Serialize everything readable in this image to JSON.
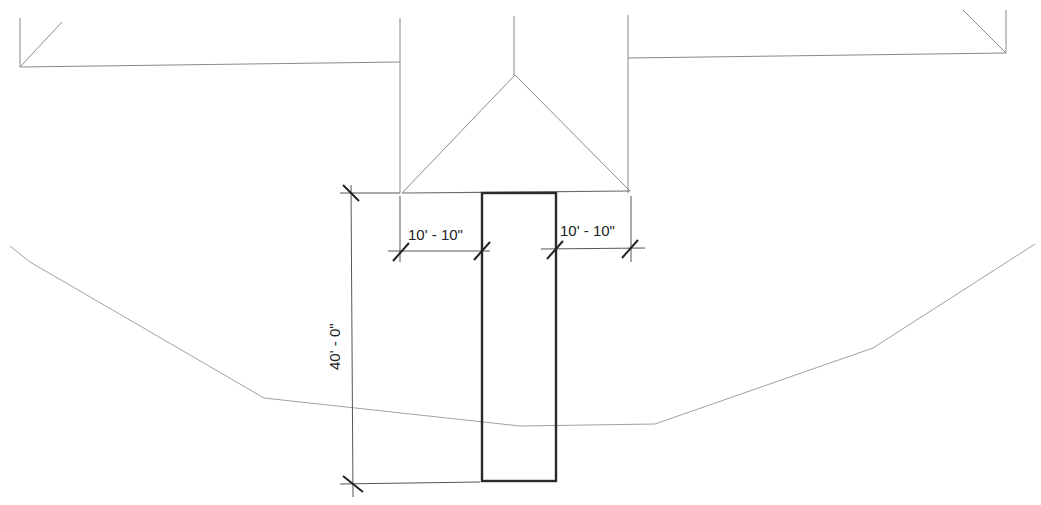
{
  "drawing": {
    "type": "architectural-plan",
    "colors": {
      "line": "#8a8a8a",
      "bold": "#2a2a2a",
      "text": "#222222"
    },
    "dimensions": {
      "left_offset": "10' - 10\"",
      "right_offset": "10' - 10\"",
      "length": "40' - 0\""
    },
    "elements": [
      {
        "name": "building-outline",
        "style": "thin"
      },
      {
        "name": "roof-ridge-lines",
        "style": "thin"
      },
      {
        "name": "walkway-rectangle",
        "style": "bold"
      },
      {
        "name": "terrain-contour",
        "style": "thin"
      },
      {
        "name": "dimension-lines",
        "style": "dim"
      }
    ]
  }
}
